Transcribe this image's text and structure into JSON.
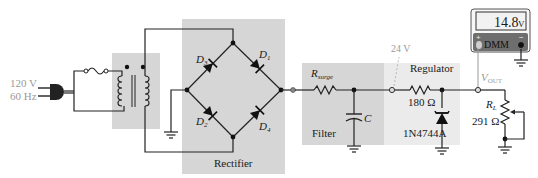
{
  "source": {
    "voltage": "120 V",
    "frequency": "60 Hz"
  },
  "blocks": {
    "rectifier": "Rectifier",
    "filter": "Filter",
    "regulator": "Regulator"
  },
  "diodes": {
    "d1": {
      "name": "D",
      "sub": "1"
    },
    "d2": {
      "name": "D",
      "sub": "2"
    },
    "d3": {
      "name": "D",
      "sub": "3"
    },
    "d4": {
      "name": "D",
      "sub": "4"
    }
  },
  "components": {
    "rsurge": {
      "name": "R",
      "sub": "surge"
    },
    "capacitor": "C",
    "series_resistor": "180 Ω",
    "zener": "1N4744A",
    "load": {
      "name": "R",
      "sub": "L",
      "value": "291 Ω"
    }
  },
  "nodes": {
    "test_point_voltage": "24 V",
    "vout": {
      "name": "V",
      "sub": "OUT"
    }
  },
  "dmm": {
    "reading": "14.8",
    "unit": "V",
    "label": "DMM",
    "plus": "+",
    "minus": "−"
  },
  "colors": {
    "block_fill": "#d6d6d6",
    "wire": "#222222",
    "test_lead": "#999999",
    "dmm_body": "#6e6e6e",
    "dmm_display": "#f2f2f2"
  }
}
